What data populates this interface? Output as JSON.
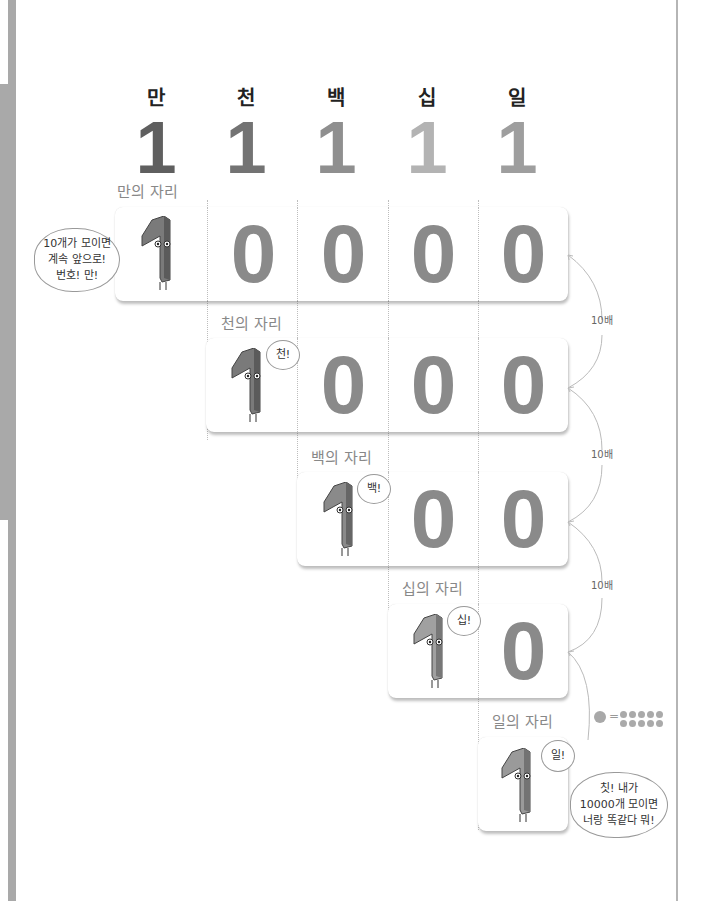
{
  "columns": [
    {
      "head": "만",
      "digit": "1",
      "color": "#5f5f5f"
    },
    {
      "head": "천",
      "digit": "1",
      "color": "#737373"
    },
    {
      "head": "백",
      "digit": "1",
      "color": "#8f8f8f"
    },
    {
      "head": "십",
      "digit": "1",
      "color": "#b3b3b3"
    },
    {
      "head": "일",
      "digit": "1",
      "color": "#9e9e9e"
    }
  ],
  "rows": [
    {
      "label": "만의 자리",
      "one": "1",
      "zeros": [
        "0",
        "0",
        "0",
        "0"
      ],
      "bubble": "10개가 모이면\n계속 앞으로!\n번호! 만!"
    },
    {
      "label": "천의 자리",
      "one": "1",
      "zeros": [
        "0",
        "0",
        "0"
      ],
      "bubble": "천!"
    },
    {
      "label": "백의 자리",
      "one": "1",
      "zeros": [
        "0",
        "0"
      ],
      "bubble": "백!"
    },
    {
      "label": "십의 자리",
      "one": "1",
      "zeros": [
        "0"
      ],
      "bubble": "십!"
    },
    {
      "label": "일의 자리",
      "one": "1",
      "zeros": [],
      "bubble": "일!"
    }
  ],
  "arrows": [
    "10배",
    "10배",
    "10배"
  ],
  "legend": {
    "equals": "=",
    "dot_count": 10
  },
  "final_bubble": "칫! 내가\n10000개 모이면\n너랑 똑같다 뭐!",
  "colors": {
    "zero": "#8a8a8a",
    "strip": "#a9a9a9",
    "arrow": "#bbbbbb"
  }
}
